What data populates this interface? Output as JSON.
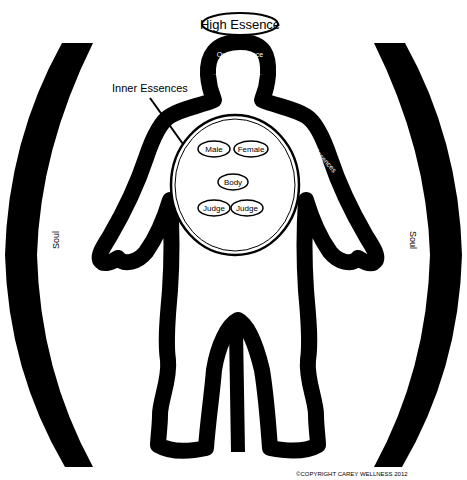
{
  "diagram": {
    "top_label": "High Essence",
    "head_label": "Outer Essence",
    "inner_label": "Inner Essences",
    "arm_label": "Outer Essences",
    "left_soul": "Soul",
    "right_soul": "Soul",
    "inner_items": [
      {
        "label": "Male"
      },
      {
        "label": "Female"
      },
      {
        "label": "Body"
      },
      {
        "label": "Judge"
      },
      {
        "label": "Judge"
      }
    ],
    "copyright": "©COPYRIGHT CAREY WELLNESS 2012"
  },
  "colors": {
    "ink": "#000000",
    "background": "#ffffff",
    "label_on_dark": "#ffffff"
  }
}
